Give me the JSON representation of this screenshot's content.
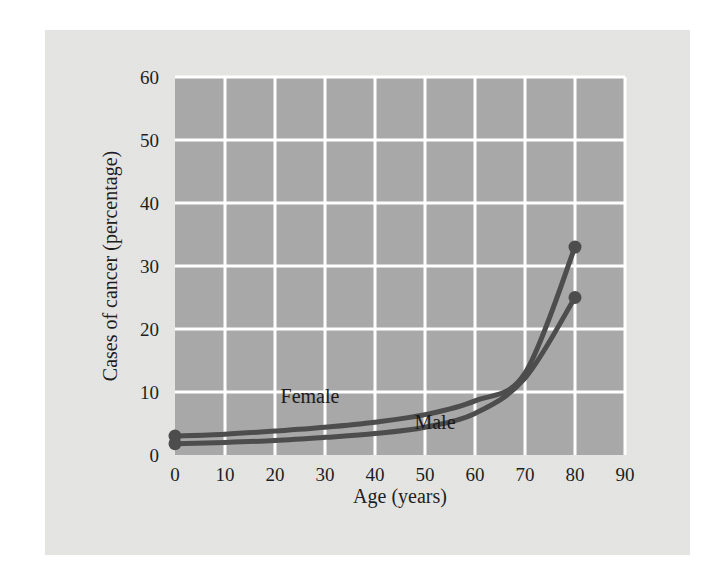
{
  "chart_data": {
    "type": "line",
    "title": "",
    "xlabel": "Age (years)",
    "ylabel": "Cases of cancer (percentage)",
    "xlim": [
      0,
      90
    ],
    "ylim": [
      0,
      60
    ],
    "xticks": [
      0,
      10,
      20,
      30,
      40,
      50,
      60,
      70,
      80,
      90
    ],
    "yticks": [
      0,
      10,
      20,
      30,
      40,
      50,
      60
    ],
    "xtick_labels": [
      "0",
      "10",
      "20",
      "30",
      "40",
      "50",
      "60",
      "70",
      "80",
      "90"
    ],
    "ytick_labels": [
      "0",
      "10",
      "20",
      "30",
      "40",
      "50",
      "60"
    ],
    "grid": true,
    "legend_position": "inline-annotation",
    "x": [
      0,
      10,
      20,
      30,
      40,
      50,
      60,
      70,
      80
    ],
    "series": [
      {
        "name": "Female",
        "label": "Female",
        "color": "#4d4d4d",
        "values": [
          3.0,
          3.3,
          3.8,
          4.4,
          5.2,
          6.4,
          8.6,
          13.0,
          33.0
        ],
        "endpoint_marker": true,
        "start_marker": true
      },
      {
        "name": "Male",
        "label": "Male",
        "color": "#4d4d4d",
        "values": [
          1.8,
          2.0,
          2.3,
          2.8,
          3.4,
          4.4,
          6.6,
          12.2,
          25.0
        ],
        "endpoint_marker": true,
        "start_marker": true
      }
    ],
    "annotations": [
      {
        "text": "Female",
        "x": 27,
        "y": 8.2
      },
      {
        "text": "Male",
        "x": 52,
        "y": 4.2
      }
    ],
    "colors": {
      "page_background": "#ffffff",
      "panel_background": "#e6e7e5",
      "plot_background": "#a8a8a8",
      "gridline": "#ffffff",
      "line": "#4d4d4d",
      "text": "#1e1e1e"
    }
  }
}
